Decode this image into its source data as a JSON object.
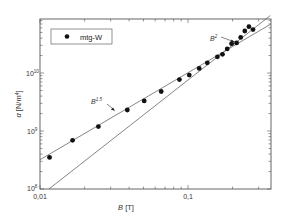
{
  "chart_data": {
    "type": "scatter",
    "title": "",
    "xlabel": "B [T]",
    "ylabel": "α [N/m⁴]",
    "xscale": "log",
    "yscale": "log",
    "xlim": [
      0.01,
      0.36
    ],
    "ylim": [
      100000000.0,
      110000000000.0
    ],
    "x_ticks": [
      {
        "value": 0.01,
        "label": "0,01"
      },
      {
        "value": 0.1,
        "label": "0,1"
      }
    ],
    "y_ticks": [
      {
        "value": 100000000.0,
        "label": "10",
        "exp": "8"
      },
      {
        "value": 1000000000.0,
        "label": "10",
        "exp": "9"
      },
      {
        "value": 10000000000.0,
        "label": "10",
        "exp": "10"
      }
    ],
    "grid": false,
    "legend": {
      "position": "upper-left",
      "entries": [
        "mtg-W"
      ]
    },
    "series": [
      {
        "name": "mtg-W",
        "marker": "filled-circle",
        "x": [
          0.0116,
          0.0166,
          0.0248,
          0.0389,
          0.0506,
          0.0659,
          0.0875,
          0.102,
          0.119,
          0.135,
          0.158,
          0.171,
          0.184,
          0.197,
          0.213,
          0.227,
          0.242,
          0.258,
          0.275
        ],
        "y": [
          350000000.0,
          690000000.0,
          1190000000.0,
          2300000000.0,
          3300000000.0,
          4800000000.0,
          7700000000.0,
          9200000000.0,
          12000000000.0,
          15000000000.0,
          19000000000.0,
          21000000000.0,
          26000000000.0,
          32000000000.0,
          33000000000.0,
          41000000000.0,
          53000000000.0,
          63000000000.0,
          56000000000.0
        ]
      }
    ],
    "fit_lines": [
      {
        "name": "B^1.5",
        "exponent": 1.5,
        "x": [
          0.01,
          0.36
        ],
        "y": [
          320000000.0,
          69000000000.0
        ]
      },
      {
        "name": "B^2",
        "exponent": 2,
        "x": [
          0.0115,
          0.36
        ],
        "y": [
          100000000.0,
          98000000000.0
        ]
      }
    ],
    "annotations": [
      {
        "text": "B",
        "sup": "1.5",
        "points_to": "B^1.5 line"
      },
      {
        "text": "B",
        "sup": "2",
        "points_to": "B^2 line"
      }
    ]
  }
}
